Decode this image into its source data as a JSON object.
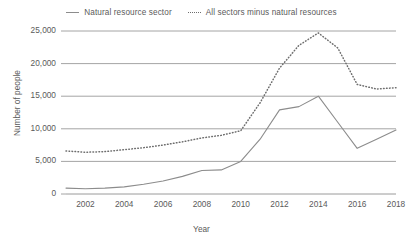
{
  "chart_data": {
    "type": "line",
    "title": "",
    "xlabel": "Year",
    "ylabel": "Number of people",
    "xlim": [
      2001,
      2018
    ],
    "ylim": [
      0,
      25000
    ],
    "ytick_labels": [
      "0",
      "5,000",
      "10,000",
      "15,000",
      "20,000",
      "25,000"
    ],
    "ytick_values": [
      0,
      5000,
      10000,
      15000,
      20000,
      25000
    ],
    "xtick_labels": [
      "2002",
      "2004",
      "2006",
      "2008",
      "2010",
      "2012",
      "2014",
      "2016",
      "2018"
    ],
    "xtick_values": [
      2002,
      2004,
      2006,
      2008,
      2010,
      2012,
      2014,
      2016,
      2018
    ],
    "grid": "horizontal",
    "legend_position": "top-center",
    "x": [
      2001,
      2002,
      2003,
      2004,
      2005,
      2006,
      2007,
      2008,
      2009,
      2010,
      2011,
      2012,
      2013,
      2014,
      2015,
      2016,
      2017,
      2018
    ],
    "series": [
      {
        "name": "Natural resource sector",
        "style": "solid",
        "color": "#8c8c8c",
        "values": [
          900,
          800,
          900,
          1100,
          1500,
          2000,
          2700,
          3600,
          3700,
          5000,
          8400,
          12900,
          13400,
          15000,
          11000,
          7000,
          8400,
          9800
        ]
      },
      {
        "name": "All sectors minus natural resources",
        "style": "dotted",
        "color": "#6e6e6e",
        "values": [
          6600,
          6400,
          6500,
          6800,
          7100,
          7500,
          8000,
          8600,
          9000,
          9700,
          14000,
          19300,
          22800,
          24700,
          22400,
          16800,
          16100,
          16300
        ]
      }
    ]
  },
  "legend": {
    "items": [
      {
        "label": "Natural resource sector",
        "style": "solid"
      },
      {
        "label": "All sectors minus natural resources",
        "style": "dotted"
      }
    ]
  },
  "axes": {
    "x_title": "Year",
    "y_title": "Number of people"
  },
  "colors": {
    "solid_line": "#8c8c8c",
    "dotted_line": "#6e6e6e",
    "gridline": "#9a9a9a",
    "text": "#5a5a5a",
    "background": "#ffffff"
  }
}
